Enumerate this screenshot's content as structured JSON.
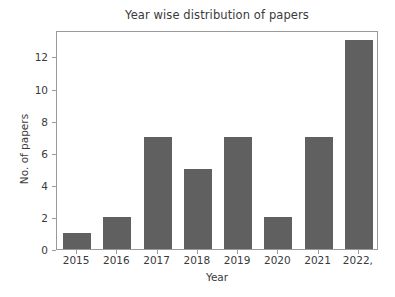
{
  "chart_data": {
    "type": "bar",
    "title": "Year wise distribution of papers",
    "xlabel": "Year",
    "ylabel": "No. of papers",
    "categories": [
      "2015",
      "2016",
      "2017",
      "2018",
      "2019",
      "2020",
      "2021",
      "2022,"
    ],
    "values": [
      1,
      2,
      7,
      5,
      7,
      2,
      7,
      13
    ],
    "ytick_labels": [
      "0",
      "2",
      "4",
      "6",
      "8",
      "10",
      "12"
    ],
    "ytick_values": [
      0,
      2,
      4,
      6,
      8,
      10,
      12
    ],
    "ylim": [
      0,
      13.65
    ],
    "grid": false,
    "legend": null,
    "bar_color": "#606060",
    "background_color": "#ffffff",
    "axes_color": "#9a9a9a",
    "text_color": "#3a3a3a",
    "bar_width_ratio": 0.7
  }
}
